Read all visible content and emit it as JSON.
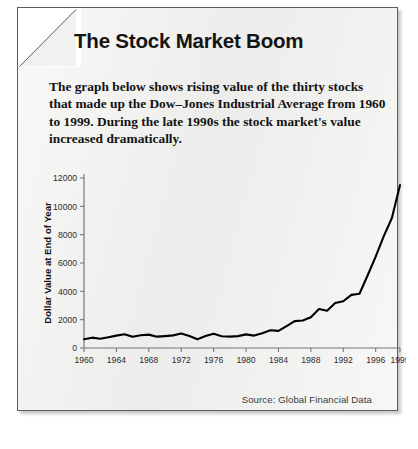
{
  "card": {
    "title": "The Stock Market Boom",
    "intro": "The graph below shows rising value of the thirty stocks that made up the Dow–Jones Industrial Average from 1960 to 1999. During the late 1990s the stock market's value increased dramatically.",
    "source": "Source: Global Financial Data"
  },
  "chart_data": {
    "type": "line",
    "title": "",
    "xlabel": "",
    "ylabel": "Dollar Value at End of Year",
    "xlim": [
      1960,
      1999
    ],
    "ylim": [
      0,
      12000
    ],
    "yticks": [
      0,
      2000,
      4000,
      6000,
      8000,
      10000,
      12000
    ],
    "ytick_labels": [
      "0",
      "2000",
      "4000",
      "6000",
      "8000",
      "10000",
      "12000"
    ],
    "xticks": [
      1960,
      1964,
      1968,
      1972,
      1976,
      1980,
      1984,
      1988,
      1992,
      1996,
      1999
    ],
    "xtick_labels": [
      "1960",
      "1964",
      "1968",
      "1972",
      "1976",
      "1980",
      "1984",
      "1988",
      "1992",
      "1996",
      "1999"
    ],
    "grid": false,
    "legend": "none",
    "line_color": "#000000",
    "x": [
      1960,
      1961,
      1962,
      1963,
      1964,
      1965,
      1966,
      1967,
      1968,
      1969,
      1970,
      1971,
      1972,
      1973,
      1974,
      1975,
      1976,
      1977,
      1978,
      1979,
      1980,
      1981,
      1982,
      1983,
      1984,
      1985,
      1986,
      1987,
      1988,
      1989,
      1990,
      1991,
      1992,
      1993,
      1994,
      1995,
      1996,
      1997,
      1998,
      1999
    ],
    "values": [
      615,
      730,
      650,
      760,
      875,
      970,
      790,
      900,
      945,
      800,
      840,
      890,
      1020,
      850,
      615,
      850,
      1000,
      830,
      805,
      840,
      960,
      875,
      1045,
      1255,
      1210,
      1545,
      1900,
      1940,
      2170,
      2750,
      2630,
      3170,
      3300,
      3750,
      3830,
      5115,
      6450,
      7900,
      9180,
      11500
    ]
  }
}
